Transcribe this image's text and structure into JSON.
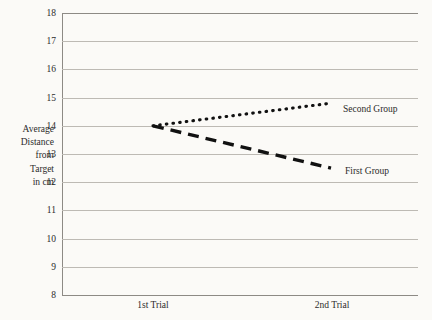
{
  "chart_data": {
    "type": "line",
    "title": "",
    "subtitle": "",
    "xlabel": "",
    "ylabel": "Average Distance from Target in cm",
    "ylabel_lines": [
      "Average",
      "Distance",
      "from",
      "Target",
      "in cm"
    ],
    "categories": [
      "1st Trial",
      "2nd Trial"
    ],
    "x_tick_labels": [
      "1st Trial",
      "2nd Trial"
    ],
    "y_tick_labels": [
      "18",
      "17",
      "16",
      "15",
      "14",
      "13",
      "12",
      "11",
      "10",
      "9",
      "8"
    ],
    "y_ticks": [
      18,
      17,
      16,
      15,
      14,
      13,
      12,
      11,
      10,
      9,
      8
    ],
    "ylim": [
      8,
      18
    ],
    "grid": true,
    "legend_position": "right-inline",
    "series": [
      {
        "name": "Second Group",
        "label": "Second Group",
        "values": [
          14.0,
          14.8
        ],
        "style": "dotted",
        "color": "#111111"
      },
      {
        "name": "First Group",
        "label": "First Group",
        "values": [
          14.0,
          12.5
        ],
        "style": "dashed",
        "color": "#111111"
      }
    ],
    "annotations": [
      {
        "name": "second-group-label",
        "text": "Second Group"
      },
      {
        "name": "first-group-label",
        "text": "First Group"
      }
    ],
    "colors": {
      "background": "#fbfaf7",
      "gridline": "#bdbab4",
      "axis": "#8d8a85",
      "series": "#111111",
      "text": "#2b2b2b"
    }
  }
}
